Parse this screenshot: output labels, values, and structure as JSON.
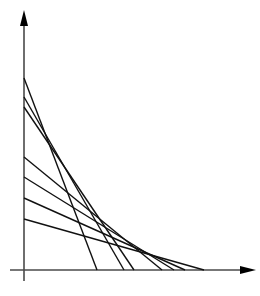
{
  "diagram": {
    "type": "tangent-line envelope",
    "axes": {
      "origin": [
        24,
        270
      ],
      "y_axis": {
        "x": 24,
        "y_top": 10,
        "y_bottom": 281,
        "arrow": "up"
      },
      "x_axis": {
        "y": 270,
        "x_left": 10,
        "x_right": 256,
        "arrow": "right"
      },
      "color": "#4a4a4a"
    },
    "line_color": "#111111",
    "lines": [
      {
        "y_intercept": 78,
        "x_intercept": 97
      },
      {
        "y_intercept": 97,
        "x_intercept": 124
      },
      {
        "y_intercept": 107,
        "x_intercept": 134
      },
      {
        "y_intercept": 157,
        "x_intercept": 162
      },
      {
        "y_intercept": 177,
        "x_intercept": 174
      },
      {
        "y_intercept": 198,
        "x_intercept": 185
      },
      {
        "y_intercept": 219,
        "x_intercept": 204
      }
    ]
  }
}
